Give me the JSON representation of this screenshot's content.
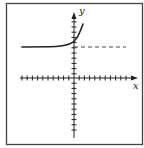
{
  "figure": {
    "type": "function-graph",
    "axes": {
      "x_label": "x",
      "y_label": "y",
      "x_ticks_left": 10,
      "x_ticks_right": 10,
      "y_ticks_up": 11,
      "y_ticks_down": 11,
      "tick_spacing_units": 1
    },
    "asymptote": {
      "style": "dashed",
      "y_value": 6,
      "orientation": "horizontal"
    },
    "curve": {
      "style": "solid",
      "shape": "exponential-growth",
      "left_behavior": "approaches y = 6",
      "right_behavior": "increases rapidly"
    },
    "colors": {
      "stroke": "#222222",
      "frame": "#444444",
      "background": "#ffffff"
    }
  }
}
